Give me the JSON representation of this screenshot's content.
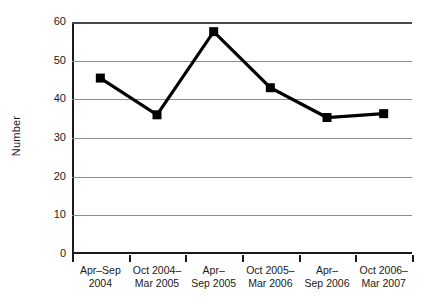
{
  "chart_data": {
    "type": "line",
    "title": "",
    "xlabel": "",
    "ylabel": "Number",
    "ylim": [
      0,
      60
    ],
    "yticks": [
      0,
      10,
      20,
      30,
      40,
      50,
      60
    ],
    "grid": true,
    "legend": "none",
    "categories": [
      "Apr–Sep 2004",
      "Oct 2004–Mar 2005",
      "Apr–Sep 2005",
      "Oct 2005–Mar 2006",
      "Apr–Sep 2006",
      "Oct 2006–Mar 2007"
    ],
    "category_lines": [
      [
        "Apr–Sep",
        "2004"
      ],
      [
        "Oct 2004–",
        "Mar 2005"
      ],
      [
        "Apr–",
        "Sep 2005"
      ],
      [
        "Oct 2005–",
        "Mar 2006"
      ],
      [
        "Apr–",
        "Sep 2006"
      ],
      [
        "Oct 2006–",
        "Mar 2007"
      ]
    ],
    "values": [
      45.5,
      36,
      57.5,
      43,
      35.3,
      36.3
    ],
    "marker": "square",
    "colors": {
      "line": "#000000",
      "marker": "#000000",
      "grid": "#8c8c8c",
      "axis": "#1a1a1a",
      "background": "#ffffff"
    }
  }
}
